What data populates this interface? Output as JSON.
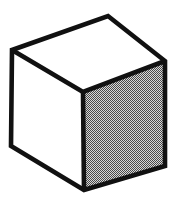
{
  "figure": {
    "title": "Isometric cube line drawing",
    "canvas": {
      "width": 185,
      "height": 214,
      "background_color": "#ffffff"
    },
    "style": {
      "stroke_color": "#111111",
      "stroke_width": 4.6,
      "white_fill": "#ffffff",
      "gray_fill": "#8a8a8a",
      "dither_light": "#d8d8d8",
      "dither_dark": "#4a4a4a"
    },
    "vertices": {
      "top_apex": {
        "label": "top-back",
        "x": 108,
        "y": 16
      },
      "left": {
        "label": "top-left",
        "x": 12,
        "y": 50
      },
      "right": {
        "label": "top-right",
        "x": 165,
        "y": 61
      },
      "center": {
        "label": "front-top",
        "x": 83,
        "y": 92
      },
      "bottom_left": {
        "label": "bottom-left",
        "x": 11,
        "y": 146
      },
      "bottom_center": {
        "label": "front-bottom",
        "x": 84,
        "y": 190
      },
      "bottom_right": {
        "label": "bottom-right",
        "x": 165,
        "y": 166
      }
    },
    "faces": [
      {
        "name": "top-face",
        "fill": "#ffffff",
        "points": "12,50 108,16 165,61 83,92"
      },
      {
        "name": "left-face",
        "fill": "#ffffff",
        "points": "12,50 83,92 84,190 11,146"
      },
      {
        "name": "right-face",
        "fill": "#8a8a8a",
        "points": "83,92 165,61 165,166 84,190"
      }
    ],
    "edges": [
      {
        "name": "edge-top-left-to-apex",
        "x1": 12,
        "y1": 50,
        "x2": 108,
        "y2": 16
      },
      {
        "name": "edge-apex-to-top-right",
        "x1": 108,
        "y1": 16,
        "x2": 165,
        "y2": 61
      },
      {
        "name": "edge-top-right-to-center",
        "x1": 165,
        "y1": 61,
        "x2": 83,
        "y2": 92
      },
      {
        "name": "edge-center-to-top-left",
        "x1": 83,
        "y1": 92,
        "x2": 12,
        "y2": 50
      },
      {
        "name": "edge-left-vertical",
        "x1": 12,
        "y1": 50,
        "x2": 11,
        "y2": 146
      },
      {
        "name": "edge-center-vertical",
        "x1": 83,
        "y1": 92,
        "x2": 84,
        "y2": 190
      },
      {
        "name": "edge-right-vertical",
        "x1": 165,
        "y1": 61,
        "x2": 165,
        "y2": 166
      },
      {
        "name": "edge-bottom-left-to-bottom-center",
        "x1": 11,
        "y1": 146,
        "x2": 84,
        "y2": 190
      },
      {
        "name": "edge-bottom-center-to-bottom-right",
        "x1": 84,
        "y1": 190,
        "x2": 165,
        "y2": 166
      }
    ]
  }
}
